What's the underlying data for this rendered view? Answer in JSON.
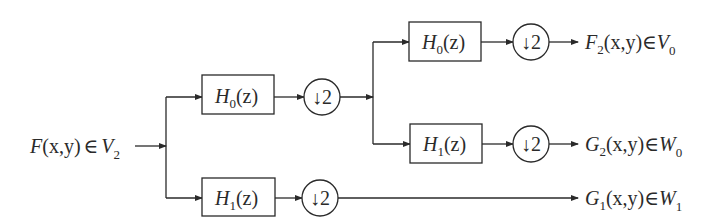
{
  "diagram": {
    "type": "two-level wavelet filter bank decomposition",
    "input": {
      "main": "F",
      "args": "(x,y)",
      "relation": "∈",
      "space": "V",
      "space_sub": "2"
    },
    "filters": {
      "level1_low": {
        "name": "H",
        "sub": "0",
        "arg": "(z)"
      },
      "level1_high": {
        "name": "H",
        "sub": "1",
        "arg": "(z)"
      },
      "level2_low": {
        "name": "H",
        "sub": "0",
        "arg": "(z)"
      },
      "level2_high": {
        "name": "H",
        "sub": "1",
        "arg": "(z)"
      }
    },
    "downsampler": {
      "arrow": "↓",
      "factor": "2"
    },
    "outputs": [
      {
        "main": "F",
        "sub": "2",
        "args": "(x,y)",
        "relation": "∈",
        "space": "V",
        "space_sub": "0"
      },
      {
        "main": "G",
        "sub": "2",
        "args": "(x,y)",
        "relation": "∈",
        "space": "W",
        "space_sub": "0"
      },
      {
        "main": "G",
        "sub": "1",
        "args": "(x,y)",
        "relation": "∈",
        "space": "W",
        "space_sub": "1"
      }
    ],
    "colors": {
      "stroke": "#2a2a2a",
      "background": "#ffffff"
    }
  }
}
